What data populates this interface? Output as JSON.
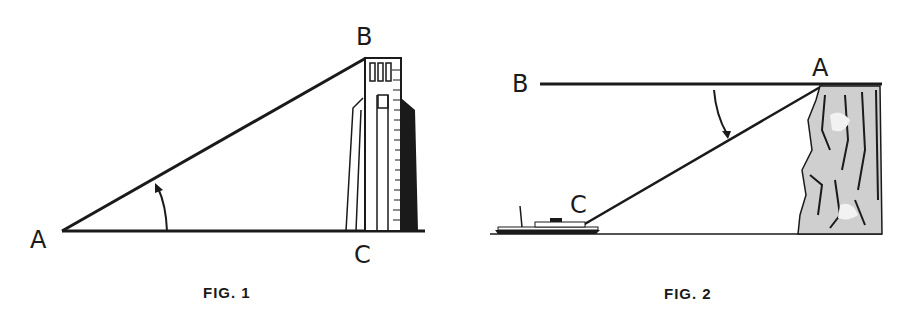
{
  "figures": [
    {
      "caption": "FIG. 1",
      "subject": "tower",
      "angle_type": "elevation",
      "points": {
        "A": "A",
        "B": "B",
        "C": "C"
      }
    },
    {
      "caption": "FIG. 2",
      "subject": "cliff-and-boat",
      "angle_type": "depression",
      "points": {
        "A": "A",
        "B": "B",
        "C": "C"
      }
    }
  ],
  "colors": {
    "ink": "#1a1a1a",
    "background": "#ffffff",
    "rock_shade": "#c8c8c8"
  }
}
